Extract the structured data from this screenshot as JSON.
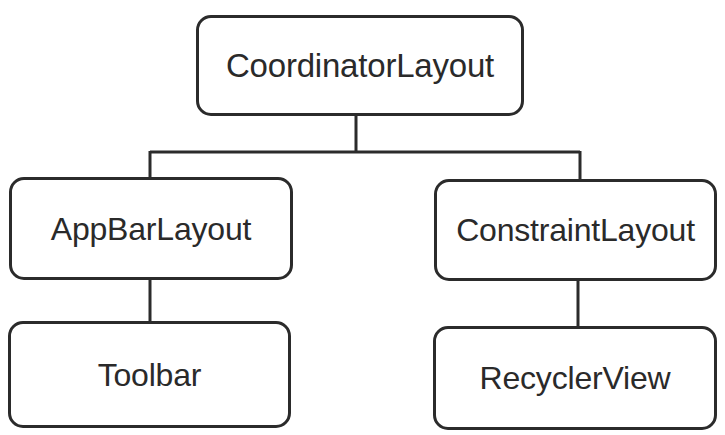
{
  "diagram": {
    "type": "tree-hierarchy",
    "orientation": "top-down",
    "background_color": "#ffffff",
    "stroke_color": "#2b2b2b",
    "text_color": "#2a2a2a",
    "nodes": [
      {
        "id": "coordinatorlayout",
        "label": "CoordinatorLayout",
        "level": 0
      },
      {
        "id": "appbarlayout",
        "label": "AppBarLayout",
        "level": 1
      },
      {
        "id": "constraintlayout",
        "label": "ConstraintLayout",
        "level": 1
      },
      {
        "id": "toolbar",
        "label": "Toolbar",
        "level": 2
      },
      {
        "id": "recyclerview",
        "label": "RecyclerView",
        "level": 2
      }
    ],
    "edges": [
      {
        "from": "coordinatorlayout",
        "to": "appbarlayout"
      },
      {
        "from": "coordinatorlayout",
        "to": "constraintlayout"
      },
      {
        "from": "appbarlayout",
        "to": "toolbar"
      },
      {
        "from": "constraintlayout",
        "to": "recyclerview"
      }
    ]
  }
}
